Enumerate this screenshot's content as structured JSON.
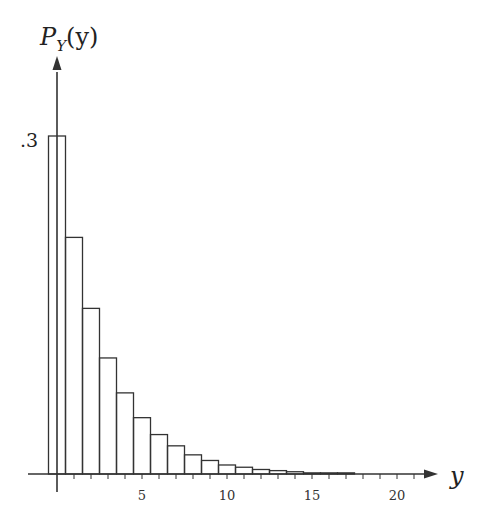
{
  "chart_data": {
    "type": "bar",
    "title": "",
    "ylabel_main": "P",
    "ylabel_sub": "Y",
    "ylabel_arg": "(y)",
    "xlabel": "y",
    "y_tick_label": ".3",
    "y_tick_value": 0.3,
    "x_tick_labels": [
      "5",
      "10",
      "15",
      "20"
    ],
    "x_tick_values": [
      5,
      10,
      15,
      20
    ],
    "xlim": [
      -1,
      22
    ],
    "ylim": [
      0,
      0.36
    ],
    "grid": false,
    "categories": [
      0,
      1,
      2,
      3,
      4,
      5,
      6,
      7,
      8,
      9,
      10,
      11,
      12,
      13,
      14,
      15,
      16,
      17,
      18,
      19,
      20
    ],
    "values": [
      0.3,
      0.21,
      0.147,
      0.103,
      0.072,
      0.05,
      0.035,
      0.025,
      0.017,
      0.012,
      0.008,
      0.006,
      0.004,
      0.003,
      0.002,
      0.001,
      0.001,
      0.001,
      0.0,
      0.0,
      0.0
    ]
  }
}
